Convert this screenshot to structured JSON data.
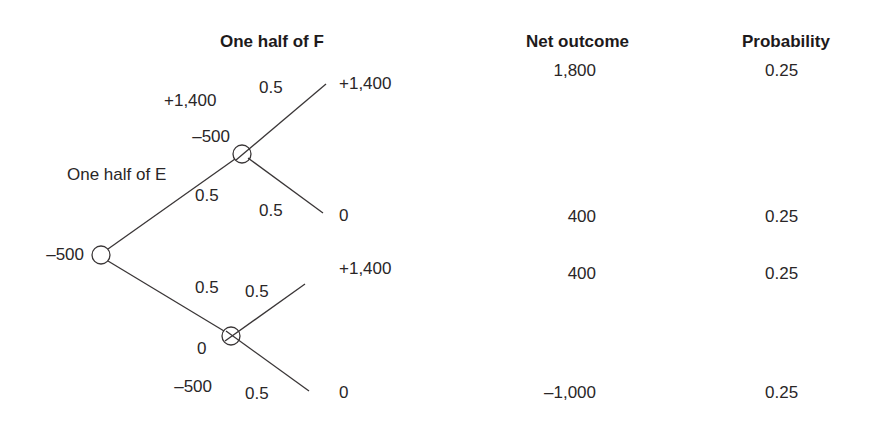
{
  "headers": {
    "tree_stage2": "One half of F",
    "net_outcome": "Net outcome",
    "probability": "Probability"
  },
  "tree": {
    "root": {
      "value": "–500"
    },
    "stage1_label": "One half of E",
    "upper_node": {
      "branch_prob": "0.5",
      "cash_in": "+1,400",
      "cash_out": "–500",
      "up_prob": "0.5",
      "up_payoff": "+1,400",
      "down_prob": "0.5",
      "down_payoff": "0"
    },
    "lower_node": {
      "branch_prob": "0.5",
      "cash_in": "0",
      "cash_out": "–500",
      "up_prob": "0.5",
      "up_payoff": "+1,400",
      "down_prob": "0.5",
      "down_payoff": "0"
    }
  },
  "outcomes": [
    {
      "net": "1,800",
      "prob": "0.25"
    },
    {
      "net": "400",
      "prob": "0.25"
    },
    {
      "net": "400",
      "prob": "0.25"
    },
    {
      "net": "–1,000",
      "prob": "0.25"
    }
  ],
  "colors": {
    "line": "#3a3637",
    "text": "#231f20"
  }
}
